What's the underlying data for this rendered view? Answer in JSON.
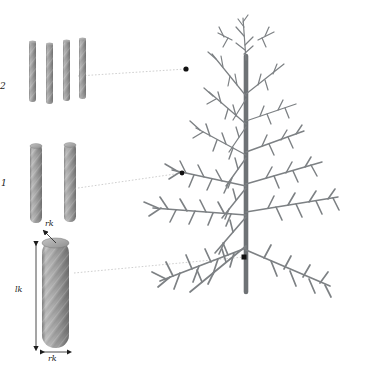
{
  "figure": {
    "background_color": "#ffffff",
    "width": 374,
    "height": 380
  },
  "palette": {
    "cylinder_light": "#b9b9b9",
    "cylinder_mid": "#9a9a9a",
    "cylinder_dark": "#7d7d7d",
    "cylinder_edge": "#6f6f6f",
    "tree_branch": "#7d8184",
    "tree_trunk": "#6e7275",
    "leader_line": "#bdbdbd",
    "marker_dot": "#111111",
    "dimension_line": "#222222",
    "label_text": "#1a1a1a"
  },
  "labels": {
    "level_twig": "2",
    "level_branch": "1",
    "radius_top": "rk",
    "radius_bottom": "rk",
    "length": "lk"
  },
  "groups": [
    {
      "name": "twig-cylinders",
      "level_label": "2",
      "count": 4,
      "cylinder_width": 7,
      "cylinder_height": 62,
      "spacing": 17,
      "origin_x": 29,
      "origin_y": 40
    },
    {
      "name": "branch-cylinders",
      "level_label": "1",
      "count": 2,
      "cylinder_width": 12,
      "cylinder_height": 80,
      "spacing": 34,
      "origin_x": 30,
      "origin_y": 143
    },
    {
      "name": "trunk-cylinder",
      "level_label": "",
      "count": 1,
      "cylinder_width": 27,
      "cylinder_height": 110,
      "spacing": 0,
      "origin_x": 42,
      "origin_y": 239
    }
  ],
  "leaders": [
    {
      "name": "leader-twig",
      "from_x": 78,
      "from_y": 76,
      "to_x": 186,
      "to_y": 69,
      "dot_x": 186,
      "dot_y": 69
    },
    {
      "name": "leader-branch",
      "from_x": 78,
      "from_y": 188,
      "to_x": 182,
      "to_y": 173,
      "dot_x": 182,
      "dot_y": 173
    },
    {
      "name": "leader-trunk",
      "from_x": 74,
      "from_y": 273,
      "to_x": 244,
      "to_y": 257,
      "dot_x": 244,
      "dot_y": 257
    }
  ],
  "dimensions": [
    {
      "name": "radius-top-arrow",
      "label": "rk",
      "label_x": 48,
      "label_y": 224,
      "orientation": "diagonal"
    },
    {
      "name": "length-arrow",
      "label": "lk",
      "label_x": 16,
      "label_y": 288,
      "orientation": "vertical"
    },
    {
      "name": "radius-bottom-arrow",
      "label": "rk",
      "label_x": 49,
      "label_y": 357,
      "orientation": "horizontal"
    }
  ],
  "tree": {
    "name": "procedural-tree",
    "trunk_x": 246,
    "trunk_top_y": 60,
    "trunk_bottom_y": 292,
    "trunk_width": 5,
    "whorls": 7
  }
}
